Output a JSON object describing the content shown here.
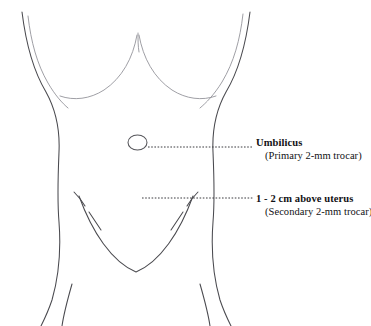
{
  "diagram": {
    "background_color": "#ffffff",
    "outline_color": "#4a4a4f",
    "text_color": "#111114",
    "width": 371,
    "height": 326
  },
  "annotations": [
    {
      "id": "umbilicus",
      "title": "Umbilicus",
      "subtitle": "(Primary 2-mm trocar)",
      "marker": "ellipse-marker",
      "leader": "dotted-leader-line"
    },
    {
      "id": "uterus",
      "title": "1 - 2 cm above uterus",
      "subtitle": "(Secondary 2-mm trocar)",
      "marker": "arrow-marker",
      "leader": "dotted-leader-line"
    }
  ]
}
